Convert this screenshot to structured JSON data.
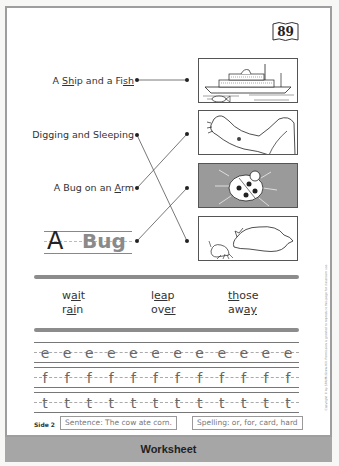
{
  "page_number": "89",
  "matching": {
    "labels": [
      {
        "prefix": "A ",
        "u1": "Sh",
        "mid": "ip and a Fi",
        "u2": "sh",
        "suffix": " ",
        "text": "A Ship and a Fish"
      },
      {
        "text": "Digging and Sleeping"
      },
      {
        "prefix": "A Bug on an ",
        "u1": "A",
        "mid": "rm",
        "text": "A Bug on an Arm"
      }
    ],
    "title_cap": "A",
    "title_word": "Bug",
    "pictures": [
      {
        "name": "ship-and-fish-picture",
        "description": "ship with fish"
      },
      {
        "name": "bug-on-arm-picture",
        "description": "arm with bug"
      },
      {
        "name": "ladybug-picture",
        "description": "ladybug"
      },
      {
        "name": "digging-sleeping-picture",
        "description": "dog sleeping, animal digging"
      }
    ],
    "connections": [
      {
        "from": "A Ship and a Fish",
        "to": "ship-and-fish-picture"
      },
      {
        "from": "Digging and Sleeping",
        "to": "digging-sleeping-picture"
      },
      {
        "from": "A Bug on an Arm",
        "to": "bug-on-arm-picture"
      },
      {
        "from": "A Bug",
        "to": "ladybug-picture"
      }
    ]
  },
  "words": {
    "col1": [
      {
        "pre": "w",
        "u": "ai",
        "post": "t"
      },
      {
        "pre": "r",
        "u": "ai",
        "post": "n"
      }
    ],
    "col2": [
      {
        "pre": "l",
        "u": "ea",
        "post": "p"
      },
      {
        "pre": "ov",
        "u": "er",
        "post": ""
      }
    ],
    "col3": [
      {
        "pre": "",
        "u": "th",
        "post": "ose"
      },
      {
        "pre": "aw",
        "u": "ay",
        "post": ""
      }
    ]
  },
  "handwriting": {
    "rows": [
      {
        "glyph": "e",
        "count": 12
      },
      {
        "glyph": "f",
        "count": 12
      },
      {
        "glyph": "t",
        "count": 12
      }
    ]
  },
  "footer": {
    "side": "Side 2",
    "sentence": "Sentence: The cow ate corn.",
    "spelling": "Spelling: or, for, card, hard"
  },
  "copyright": "Copyright © by SRA/McGraw-Hill. Permission is granted to reproduce this page for classroom use.",
  "banner": "Worksheet",
  "colors": {
    "border": "#9e9e9e",
    "banner": "#a6a6a6",
    "shaded_picture": "#9a9a9a",
    "rule": "#8c8c8c"
  }
}
